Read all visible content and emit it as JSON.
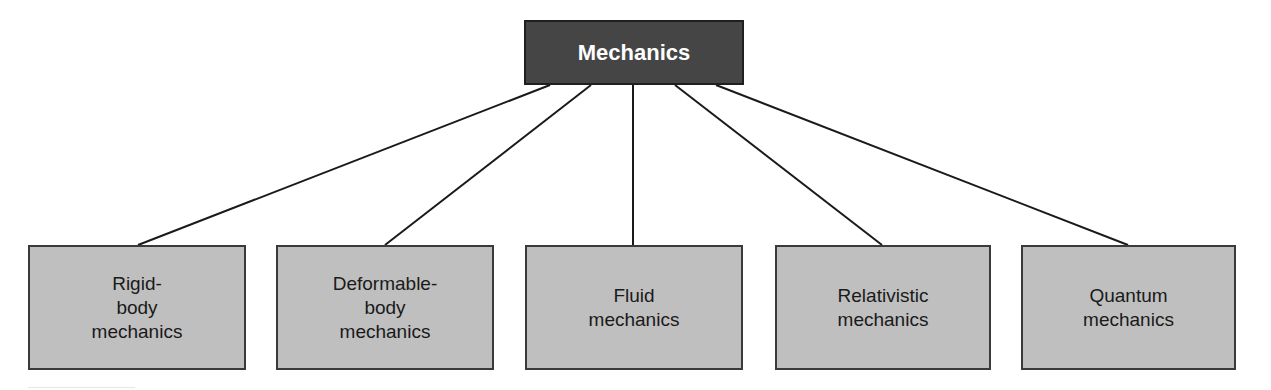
{
  "diagram": {
    "type": "hierarchy-tree",
    "colors": {
      "root_fill": "#454545",
      "root_text": "#ffffff",
      "child_fill": "#bfbfbf",
      "child_text": "#1a1a1a",
      "connector": "#1a1a1a"
    },
    "root": {
      "label": "Mechanics",
      "box": {
        "x": 524,
        "y": 20,
        "w": 220,
        "h": 65
      }
    },
    "children": [
      {
        "label": "Rigid-\nbody\nmechanics",
        "box": {
          "x": 28,
          "y": 245,
          "w": 218,
          "h": 125
        },
        "anchor_top": 138,
        "anchor_root": 550
      },
      {
        "label": "Deformable-\nbody\nmechanics",
        "box": {
          "x": 276,
          "y": 245,
          "w": 218,
          "h": 125
        },
        "anchor_top": 385,
        "anchor_root": 591
      },
      {
        "label": "Fluid\nmechanics",
        "box": {
          "x": 525,
          "y": 245,
          "w": 218,
          "h": 125
        },
        "anchor_top": 633,
        "anchor_root": 633
      },
      {
        "label": "Relativistic\nmechanics",
        "box": {
          "x": 775,
          "y": 245,
          "w": 216,
          "h": 125
        },
        "anchor_top": 882,
        "anchor_root": 675
      },
      {
        "label": "Quantum\nmechanics",
        "box": {
          "x": 1021,
          "y": 245,
          "w": 215,
          "h": 125
        },
        "anchor_top": 1128,
        "anchor_root": 716
      }
    ]
  }
}
